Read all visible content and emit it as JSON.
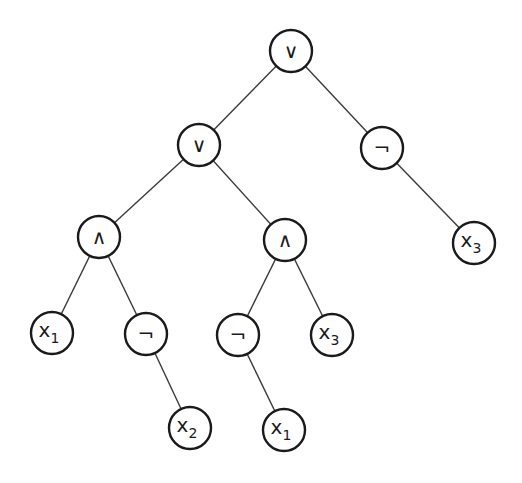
{
  "diagram": {
    "type": "expression-tree",
    "nodes": [
      {
        "id": "n0",
        "label": "∨",
        "sub": "",
        "x": 291,
        "y": 51
      },
      {
        "id": "n1",
        "label": "∨",
        "sub": "",
        "x": 199,
        "y": 145
      },
      {
        "id": "n2",
        "label": "¬",
        "sub": "",
        "x": 382,
        "y": 148
      },
      {
        "id": "n3",
        "label": "∧",
        "sub": "",
        "x": 99,
        "y": 237
      },
      {
        "id": "n4",
        "label": "∧",
        "sub": "",
        "x": 285,
        "y": 240
      },
      {
        "id": "n5",
        "label": "x",
        "sub": "3",
        "x": 474,
        "y": 243
      },
      {
        "id": "n6",
        "label": "x",
        "sub": "1",
        "x": 52,
        "y": 333
      },
      {
        "id": "n7",
        "label": "¬",
        "sub": "",
        "x": 146,
        "y": 334
      },
      {
        "id": "n8",
        "label": "¬",
        "sub": "",
        "x": 238,
        "y": 335
      },
      {
        "id": "n9",
        "label": "x",
        "sub": "3",
        "x": 332,
        "y": 335
      },
      {
        "id": "n10",
        "label": "x",
        "sub": "2",
        "x": 190,
        "y": 428
      },
      {
        "id": "n11",
        "label": "x",
        "sub": "1",
        "x": 284,
        "y": 430
      }
    ],
    "edges": [
      [
        "n0",
        "n1"
      ],
      [
        "n0",
        "n2"
      ],
      [
        "n1",
        "n3"
      ],
      [
        "n1",
        "n4"
      ],
      [
        "n2",
        "n5"
      ],
      [
        "n3",
        "n6"
      ],
      [
        "n3",
        "n7"
      ],
      [
        "n4",
        "n8"
      ],
      [
        "n4",
        "n9"
      ],
      [
        "n7",
        "n10"
      ],
      [
        "n8",
        "n11"
      ]
    ],
    "node_radius": 21
  }
}
